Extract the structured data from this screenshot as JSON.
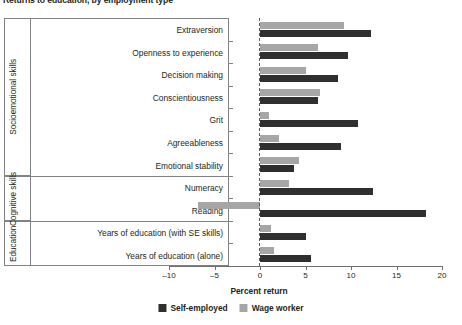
{
  "chart_data": {
    "type": "bar",
    "orientation": "horizontal",
    "title": "Returns to education, by employment type",
    "xlabel": "Percent return",
    "ylabel": "",
    "xlim": [
      -10,
      20
    ],
    "xticks": [
      -10,
      -5,
      0,
      5,
      10,
      15,
      20
    ],
    "xticklabels": [
      "–10",
      "–5",
      "0",
      "5",
      "10",
      "15",
      "20"
    ],
    "grid": false,
    "zero_reference_line": true,
    "legend_position": "bottom",
    "categories": [
      "Extraversion",
      "Openness to experience",
      "Decision making",
      "Conscientiousness",
      "Grit",
      "Agreeableness",
      "Emotional stability",
      "Numeracy",
      "Reading",
      "Years of education (with SE skills)",
      "Years of education (alone)"
    ],
    "groups": [
      {
        "name": "Socioemotional skills",
        "categories": [
          "Extraversion",
          "Openness to experience",
          "Decision making",
          "Conscientiousness",
          "Grit",
          "Agreeableness",
          "Emotional stability"
        ]
      },
      {
        "name": "Cognitive skills",
        "categories": [
          "Numeracy",
          "Reading"
        ]
      },
      {
        "name": "Education",
        "categories": [
          "Years of education (with SE skills)",
          "Years of education (alone)"
        ]
      }
    ],
    "series": [
      {
        "name": "Self-employed",
        "color": "#2f2f2f",
        "values": [
          12.2,
          9.7,
          8.6,
          6.4,
          10.8,
          8.9,
          3.7,
          12.4,
          18.2,
          5.0,
          5.6
        ]
      },
      {
        "name": "Wage worker",
        "color": "#a6a6a6",
        "values": [
          9.2,
          6.4,
          5.0,
          6.6,
          1.0,
          2.1,
          4.3,
          3.2,
          -6.8,
          1.2,
          1.5
        ]
      }
    ]
  },
  "legend": {
    "items": [
      {
        "label": "Self-employed",
        "swatch": "self"
      },
      {
        "label": "Wage worker",
        "swatch": "wage"
      }
    ]
  }
}
